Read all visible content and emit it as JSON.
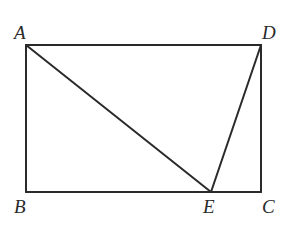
{
  "diagram": {
    "type": "geometry",
    "shape": "rectangle ABCD with point E on BC, segments AE and DE",
    "points": {
      "A": {
        "label": "A",
        "x": 26,
        "y": 45
      },
      "B": {
        "label": "B",
        "x": 26,
        "y": 192
      },
      "C": {
        "label": "C",
        "x": 261,
        "y": 192
      },
      "D": {
        "label": "D",
        "x": 261,
        "y": 45
      },
      "E": {
        "label": "E",
        "x": 211,
        "y": 192
      }
    },
    "segments": [
      "AB",
      "BC",
      "CD",
      "DA",
      "AE",
      "DE"
    ],
    "line_color": "#2a2a2a"
  }
}
